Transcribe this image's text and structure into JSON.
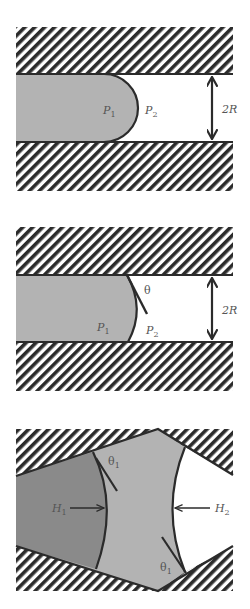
{
  "figure": {
    "panel1": {
      "description": "Liquid plug with rounded meniscus in capillary",
      "labels": {
        "p_left": "P",
        "p_left_sub": "1",
        "p_right": "P",
        "p_right_sub": "2",
        "diameter": "2R"
      }
    },
    "panel2": {
      "description": "Liquid meniscus with contact angle theta in capillary",
      "labels": {
        "theta": "θ",
        "p_left": "P",
        "p_left_sub": "1",
        "p_right": "P",
        "p_right_sub": "2",
        "diameter": "2R"
      }
    },
    "panel3": {
      "description": "Three-phase configuration in converging-diverging pore",
      "labels": {
        "theta_top": "θ",
        "theta_top_sub": "1",
        "theta_bottom": "θ",
        "theta_bottom_sub": "1",
        "h_left": "H",
        "h_left_sub": "1",
        "h_right": "H",
        "h_right_sub": "2"
      }
    }
  },
  "colors": {
    "line": "#2b2b2b",
    "fluid_light": "#b3b3b3",
    "fluid_dark": "#8a8a8a",
    "hatch": "#2b2b2b",
    "background": "#ffffff"
  }
}
